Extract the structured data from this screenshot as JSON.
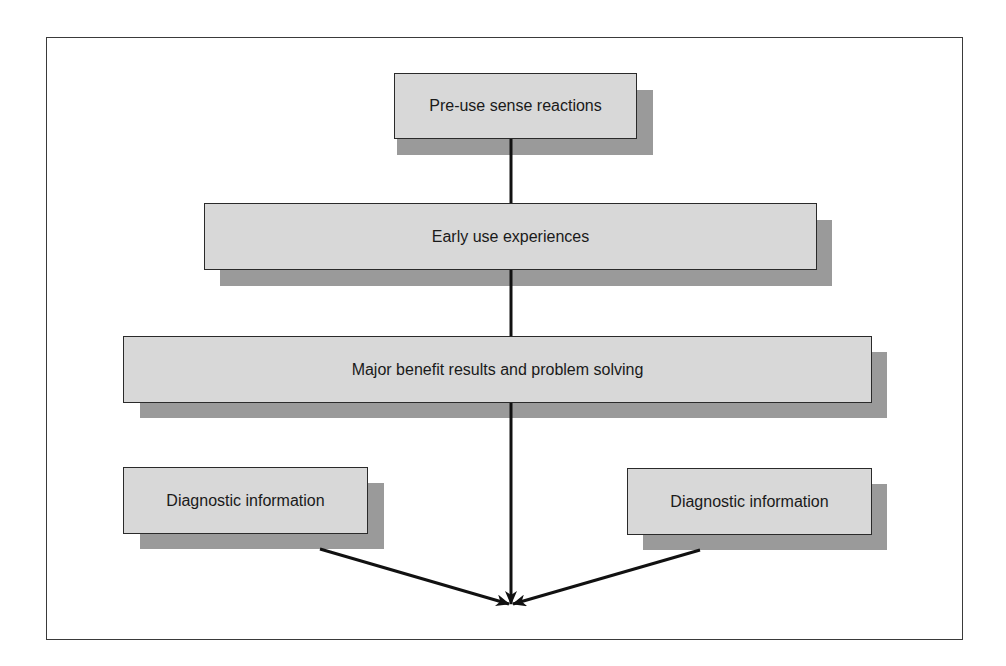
{
  "diagram": {
    "type": "flowchart",
    "nodes": [
      {
        "id": "pre-use",
        "label": "Pre-use sense reactions"
      },
      {
        "id": "early-use",
        "label": "Early use experiences"
      },
      {
        "id": "major-benefit",
        "label": "Major benefit results and problem solving"
      },
      {
        "id": "diag-left",
        "label": "Diagnostic information"
      },
      {
        "id": "diag-right",
        "label": "Diagnostic information"
      }
    ],
    "edges": [
      {
        "from": "pre-use",
        "to": "early-use"
      },
      {
        "from": "early-use",
        "to": "major-benefit"
      },
      {
        "from": "major-benefit",
        "to": "convergence-point",
        "arrow": true
      },
      {
        "from": "diag-left",
        "to": "convergence-point",
        "arrow": true
      },
      {
        "from": "diag-right",
        "to": "convergence-point",
        "arrow": true
      }
    ]
  },
  "colors": {
    "box_fill": "#d8d8d8",
    "box_shadow": "#9a9a9a",
    "border": "#2a2a2a",
    "line": "#111111"
  }
}
